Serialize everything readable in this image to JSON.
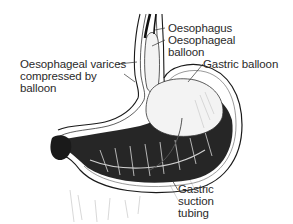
{
  "diagram": {
    "labels": [
      {
        "id": "oesophagus",
        "text": "Oesophagus"
      },
      {
        "id": "oesophageal_balloon",
        "line1": "Oesophageal",
        "line2": "balloon"
      },
      {
        "id": "oesophageal_varices",
        "line1": "Oesophageal varices",
        "line2": "compressed by",
        "line3": "balloon"
      },
      {
        "id": "gastric_balloon",
        "text": "Gastric balloon"
      },
      {
        "id": "gastric_suction_tubing",
        "line1": "Gastric",
        "line2": "suction",
        "line3": "tubing"
      }
    ],
    "colors": {
      "ink": "#1a1a1a",
      "text": "#2a2a2a",
      "background": "#ffffff",
      "balloon_fill": "#f3f3f3"
    }
  }
}
